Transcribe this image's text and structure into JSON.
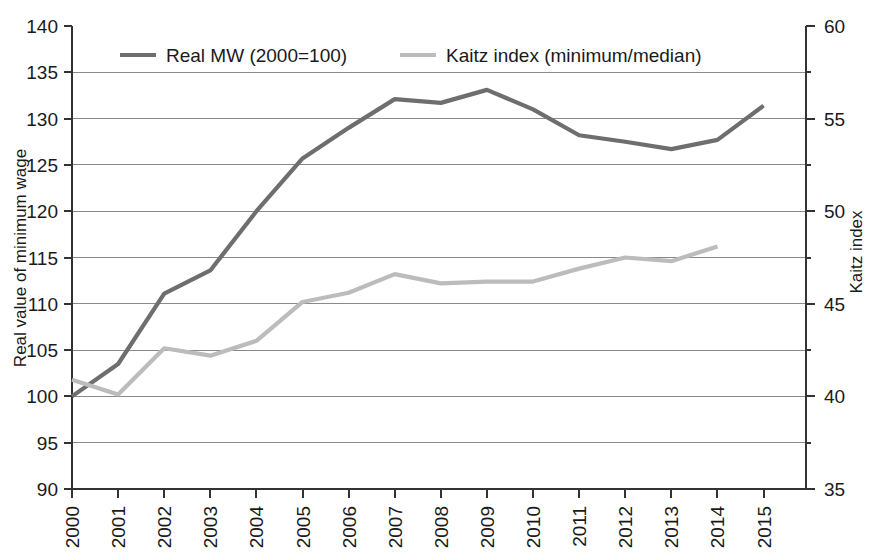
{
  "chart_data": {
    "type": "line",
    "title": "",
    "xlabel": "",
    "categories": [
      "2000",
      "2001",
      "2002",
      "2003",
      "2004",
      "2005",
      "2006",
      "2007",
      "2008",
      "2009",
      "2010",
      "2011",
      "2012",
      "2013",
      "2014",
      "2015"
    ],
    "grid": true,
    "legend_position": "top-inside",
    "axes": {
      "left": {
        "label": "Real value of minimum wage",
        "min": 90,
        "max": 140,
        "step": 5,
        "ticks": [
          "90",
          "95",
          "100",
          "105",
          "110",
          "115",
          "120",
          "125",
          "130",
          "135",
          "140"
        ]
      },
      "right": {
        "label": "Kaitz index",
        "min": 35,
        "max": 60,
        "step": 2.5,
        "ticks": [
          "35",
          "40",
          "45",
          "50",
          "55",
          "60"
        ],
        "labeled_ticks": [
          "35",
          "40",
          "45",
          "50",
          "55",
          "60"
        ]
      }
    },
    "series": [
      {
        "name": "Real MW (2000=100)",
        "axis": "left",
        "color": "#6e6e6e",
        "x": [
          "2000",
          "2001",
          "2002",
          "2003",
          "2004",
          "2005",
          "2006",
          "2007",
          "2008",
          "2009",
          "2010",
          "2011",
          "2012",
          "2013",
          "2014",
          "2015"
        ],
        "values": [
          100.0,
          103.5,
          111.1,
          113.6,
          120.0,
          125.7,
          129.0,
          132.1,
          131.7,
          133.1,
          131.0,
          128.2,
          127.5,
          126.7,
          127.7,
          131.4
        ]
      },
      {
        "name": "Kaitz index (minimum/median)",
        "axis": "right",
        "color": "#bcbcbc",
        "x": [
          "2000",
          "2001",
          "2002",
          "2003",
          "2004",
          "2005",
          "2006",
          "2007",
          "2008",
          "2009",
          "2010",
          "2011",
          "2012",
          "2013",
          "2014"
        ],
        "values": [
          40.9,
          40.1,
          42.6,
          42.2,
          43.0,
          45.1,
          45.6,
          46.6,
          46.1,
          46.2,
          46.2,
          46.9,
          47.5,
          47.3,
          48.1
        ]
      }
    ],
    "series_left_label_values": {
      "Kaitz index (minimum/median)": [
        101.8,
        100.3,
        105.2,
        104.5,
        106.0,
        110.2,
        111.2,
        113.2,
        112.2,
        112.4,
        112.4,
        113.8,
        115.0,
        114.6,
        116.3
      ]
    }
  },
  "legend": {
    "items": [
      {
        "label": "Real MW (2000=100)",
        "color": "#6e6e6e"
      },
      {
        "label": "Kaitz index (minimum/median)",
        "color": "#bcbcbc"
      }
    ]
  },
  "left_axis_title": "Real value of minimum wage",
  "right_axis_title": "Kaitz index"
}
